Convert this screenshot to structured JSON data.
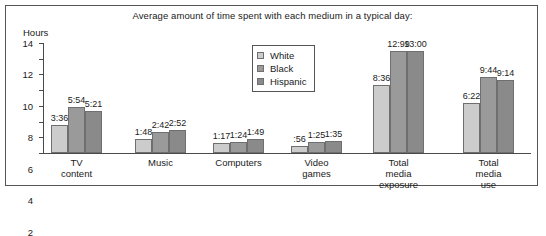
{
  "chart_data": {
    "type": "bar",
    "title": "Average amount of time spent with each medium in a typical day:",
    "ylabel": "Hours",
    "xlabel": "",
    "ylim": [
      0,
      14
    ],
    "yticks": [
      0,
      2,
      4,
      6,
      8,
      10,
      12,
      14
    ],
    "grid": false,
    "legend_position": "upper-center",
    "categories": [
      "TV content",
      "Music",
      "Computers",
      "Video games",
      "Total media\nexposure",
      "Total media\nuse"
    ],
    "series": [
      {
        "name": "White",
        "color": "#cccccc",
        "labels": [
          "3:36",
          "1:48",
          "1:17",
          ":56",
          "8:36",
          "6:22"
        ],
        "values": [
          3.6,
          1.8,
          1.283,
          0.933,
          8.6,
          6.367
        ]
      },
      {
        "name": "Black",
        "color": "#9a9a9a",
        "labels": [
          "5:54",
          "2:42",
          "1:24",
          "1:25",
          "12:99",
          "9:44"
        ],
        "values": [
          5.9,
          2.7,
          1.4,
          1.417,
          12.99,
          9.733
        ]
      },
      {
        "name": "Hispanic",
        "color": "#8a8a8a",
        "labels": [
          "5:21",
          "2:52",
          "1:49",
          "1:35",
          "13:00",
          "9:14"
        ],
        "values": [
          5.35,
          2.867,
          1.817,
          1.583,
          13.0,
          9.233
        ]
      }
    ]
  }
}
